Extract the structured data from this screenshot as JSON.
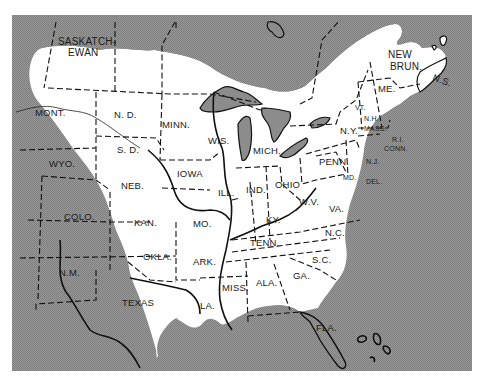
{
  "map": {
    "colors": {
      "frame_fill": "#8c8c8c",
      "range_fill": "#ffffff",
      "page_bg": "#ffffff",
      "line": "#111111"
    },
    "provinces": [
      {
        "id": "saskatchewan",
        "label_line1": "SASKATCH-",
        "label_line2": "EWAN"
      },
      {
        "id": "ontario",
        "label": "ONTARIO"
      },
      {
        "id": "new-brunswick",
        "label_line1": "NEW",
        "label_line2": "BRUN."
      },
      {
        "id": "nova-scotia",
        "label": "N.S."
      }
    ],
    "states": [
      {
        "id": "mont",
        "label": "MONT."
      },
      {
        "id": "nd",
        "label": "N. D."
      },
      {
        "id": "minn",
        "label": "MINN."
      },
      {
        "id": "wyo",
        "label": "WYO."
      },
      {
        "id": "sd",
        "label": "S. D."
      },
      {
        "id": "wis",
        "label": "WIS."
      },
      {
        "id": "mich",
        "label": "MICH."
      },
      {
        "id": "iowa",
        "label": "IOWA"
      },
      {
        "id": "neb",
        "label": "NEB."
      },
      {
        "id": "colo",
        "label": "COLO."
      },
      {
        "id": "ill",
        "label": "ILL."
      },
      {
        "id": "ind",
        "label": "IND."
      },
      {
        "id": "ohio",
        "label": "OHIO"
      },
      {
        "id": "kan",
        "label": "KAN."
      },
      {
        "id": "mo",
        "label": "MO."
      },
      {
        "id": "ky",
        "label": "KY."
      },
      {
        "id": "wv",
        "label": "W.V."
      },
      {
        "id": "va",
        "label": "VA."
      },
      {
        "id": "okla",
        "label": "OKLA."
      },
      {
        "id": "ark",
        "label": "ARK."
      },
      {
        "id": "tenn",
        "label": "TENN."
      },
      {
        "id": "nc",
        "label": "N.C."
      },
      {
        "id": "nm",
        "label": "N.M."
      },
      {
        "id": "sc",
        "label": "S.C."
      },
      {
        "id": "texas",
        "label": "TEXAS"
      },
      {
        "id": "miss",
        "label": "MISS."
      },
      {
        "id": "ala",
        "label": "ALA."
      },
      {
        "id": "ga",
        "label": "GA."
      },
      {
        "id": "la",
        "label": "LA."
      },
      {
        "id": "fla",
        "label": "FLA."
      },
      {
        "id": "ny",
        "label": "N.Y."
      },
      {
        "id": "penn",
        "label": "PENN."
      },
      {
        "id": "me",
        "label": "ME."
      },
      {
        "id": "vt",
        "label": "VT."
      },
      {
        "id": "nh",
        "label": "N.H."
      },
      {
        "id": "mass",
        "label": "MASS."
      },
      {
        "id": "ri",
        "label": "R.I."
      },
      {
        "id": "conn",
        "label": "CONN."
      },
      {
        "id": "nj",
        "label": "N.J."
      },
      {
        "id": "md",
        "label": "MD."
      },
      {
        "id": "del",
        "label": "DEL."
      }
    ]
  }
}
